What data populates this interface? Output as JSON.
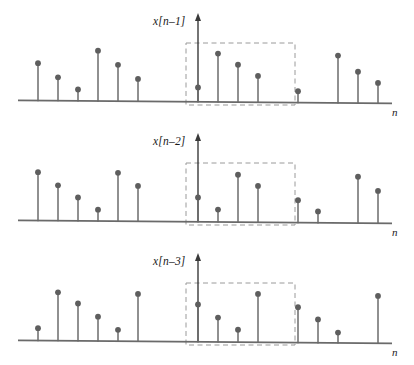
{
  "figure": {
    "background": "#ffffff",
    "stem_color": "#6b6b6b",
    "dot_color": "#5e5e5e",
    "axis_color": "#6a6a6a",
    "dash_color": "#9a9a9a",
    "text_color": "#1a1a1a",
    "width": 414,
    "height": 365
  },
  "plots": [
    {
      "id": "plot-1",
      "signal_label": "x[n–1]",
      "axis_label": "n",
      "baseline_y": 100,
      "arrow_x": 198,
      "arrow_top_y": 14,
      "window_box": {
        "x": 186,
        "y": 43,
        "width": 109,
        "height": 62
      },
      "dashed": true
    },
    {
      "id": "plot-2",
      "signal_label": "x[n–2]",
      "axis_label": "n",
      "baseline_y": 100,
      "arrow_x": 198,
      "arrow_top_y": 14,
      "window_box": {
        "x": 186,
        "y": 43,
        "width": 109,
        "height": 62
      },
      "dashed": true
    },
    {
      "id": "plot-3",
      "signal_label": "x[n–3]",
      "axis_label": "n",
      "baseline_y": 100,
      "arrow_x": 198,
      "arrow_top_y": 14,
      "window_box": {
        "x": 186,
        "y": 43,
        "width": 109,
        "height": 62
      },
      "dashed": true
    }
  ],
  "chart_data": {
    "type": "line",
    "title": "",
    "subtitle": "",
    "xlabel": "n",
    "ylabel": "",
    "grid": false,
    "legend": "none",
    "style": "stem",
    "x": [
      38,
      58,
      78,
      98,
      118,
      138,
      158,
      178,
      198,
      218,
      238,
      258,
      278,
      298,
      318,
      338,
      358,
      378
    ],
    "xlim": [
      18,
      398
    ],
    "ylim": [
      0,
      1
    ],
    "series": [
      {
        "name": "x[n–1]",
        "stem_heights_px": [
          37,
          23,
          11,
          50,
          36,
          22,
          0,
          0,
          14,
          48,
          37,
          26,
          0,
          11,
          0,
          47,
          31,
          20
        ],
        "values": [
          0.62,
          0.38,
          0.18,
          0.83,
          0.6,
          0.37,
          0.0,
          0.0,
          0.23,
          0.8,
          0.62,
          0.43,
          0.0,
          0.18,
          0.0,
          0.78,
          0.52,
          0.33
        ],
        "visible_indices": [
          0,
          1,
          2,
          3,
          4,
          5,
          8,
          9,
          10,
          11,
          13,
          15,
          16,
          17
        ]
      },
      {
        "name": "x[n–2]",
        "stem_heights_px": [
          48,
          35,
          23,
          11,
          48,
          35,
          0,
          0,
          24,
          12,
          47,
          36,
          0,
          22,
          11,
          0,
          46,
          32
        ],
        "values": [
          0.8,
          0.58,
          0.38,
          0.18,
          0.8,
          0.58,
          0.0,
          0.0,
          0.4,
          0.2,
          0.78,
          0.6,
          0.0,
          0.37,
          0.18,
          0.0,
          0.77,
          0.53
        ],
        "visible_indices": [
          0,
          1,
          2,
          3,
          4,
          5,
          8,
          9,
          10,
          11,
          13,
          14,
          16,
          17
        ]
      },
      {
        "name": "x[n–3]",
        "stem_heights_px": [
          12,
          48,
          37,
          24,
          11,
          47,
          0,
          0,
          37,
          24,
          12,
          48,
          0,
          35,
          23,
          10,
          0,
          47
        ],
        "values": [
          0.2,
          0.8,
          0.62,
          0.4,
          0.18,
          0.78,
          0.0,
          0.0,
          0.62,
          0.4,
          0.2,
          0.8,
          0.0,
          0.58,
          0.38,
          0.17,
          0.0,
          0.78
        ],
        "visible_indices": [
          0,
          1,
          2,
          3,
          4,
          5,
          8,
          9,
          10,
          11,
          13,
          14,
          15,
          17
        ]
      }
    ]
  },
  "labels": {
    "plot1_signal": "x[n–1]",
    "plot2_signal": "x[n–2]",
    "plot3_signal": "x[n–3]",
    "axis_n": "n"
  }
}
